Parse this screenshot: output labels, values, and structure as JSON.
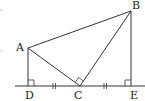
{
  "diagram": {
    "type": "geometry",
    "stroke_color": "#333333",
    "points": {
      "A": {
        "label": "A",
        "x": 28,
        "y": 48
      },
      "B": {
        "label": "B",
        "x": 131,
        "y": 11
      },
      "C": {
        "label": "C",
        "x": 80,
        "y": 86
      },
      "D": {
        "label": "D",
        "x": 28,
        "y": 86
      },
      "E": {
        "label": "E",
        "x": 131,
        "y": 86
      }
    },
    "segments": [
      [
        "A",
        "B"
      ],
      [
        "A",
        "C"
      ],
      [
        "B",
        "C"
      ],
      [
        "A",
        "D"
      ],
      [
        "B",
        "E"
      ]
    ],
    "baseline": {
      "x1": 15,
      "x2": 145,
      "y": 86
    },
    "right_angles": [
      "D",
      "C",
      "E"
    ],
    "equal_marks": [
      {
        "between": [
          "D",
          "C"
        ],
        "ticks": 2
      },
      {
        "between": [
          "C",
          "E"
        ],
        "ticks": 2
      }
    ]
  }
}
